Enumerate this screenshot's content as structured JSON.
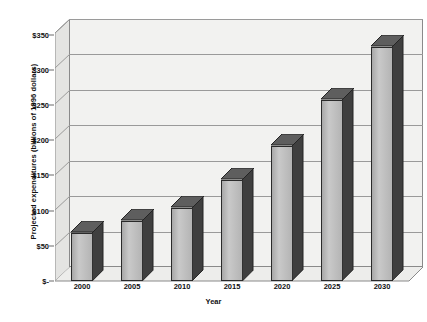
{
  "chart_data": {
    "type": "bar",
    "title": "",
    "subtitle": "",
    "xlabel": "Year",
    "ylabel": "Projected expenditures (billions of 1996 dollars)",
    "categories": [
      "2000",
      "2005",
      "2010",
      "2015",
      "2020",
      "2025",
      "2030"
    ],
    "values": [
      68,
      85,
      103,
      143,
      190,
      255,
      330
    ],
    "series": [
      {
        "name": "Projected expenditures",
        "values": [
          68,
          85,
          103,
          143,
          190,
          255,
          330
        ]
      }
    ],
    "ylim": [
      0,
      350
    ],
    "ytick_values": [
      0,
      50,
      100,
      150,
      200,
      250,
      300,
      350
    ],
    "ytick_labels": [
      "$-",
      "$50",
      "$100",
      "$150",
      "$200",
      "$250",
      "$300",
      "$350"
    ],
    "xtick_labels": [
      "2000",
      "2005",
      "2010",
      "2015",
      "2020",
      "2025",
      "2030"
    ],
    "grid": true,
    "grid_axis": "y",
    "legend": false,
    "legend_position": "none",
    "style": "3d-column",
    "colors": {
      "bar_front": "#c0c0c0",
      "bar_side": "#3a3a3a",
      "bar_top": "#5a5a5a",
      "bar_outline": "#2a2a2a",
      "plot_back_wall": "#f2f2f0",
      "plot_side_wall": "#e4e4e2",
      "plot_floor": "#ededeb",
      "gridline": "#9a9a9a",
      "axis": "#6b6b6b",
      "text": "#111111",
      "background": "#ffffff"
    }
  }
}
